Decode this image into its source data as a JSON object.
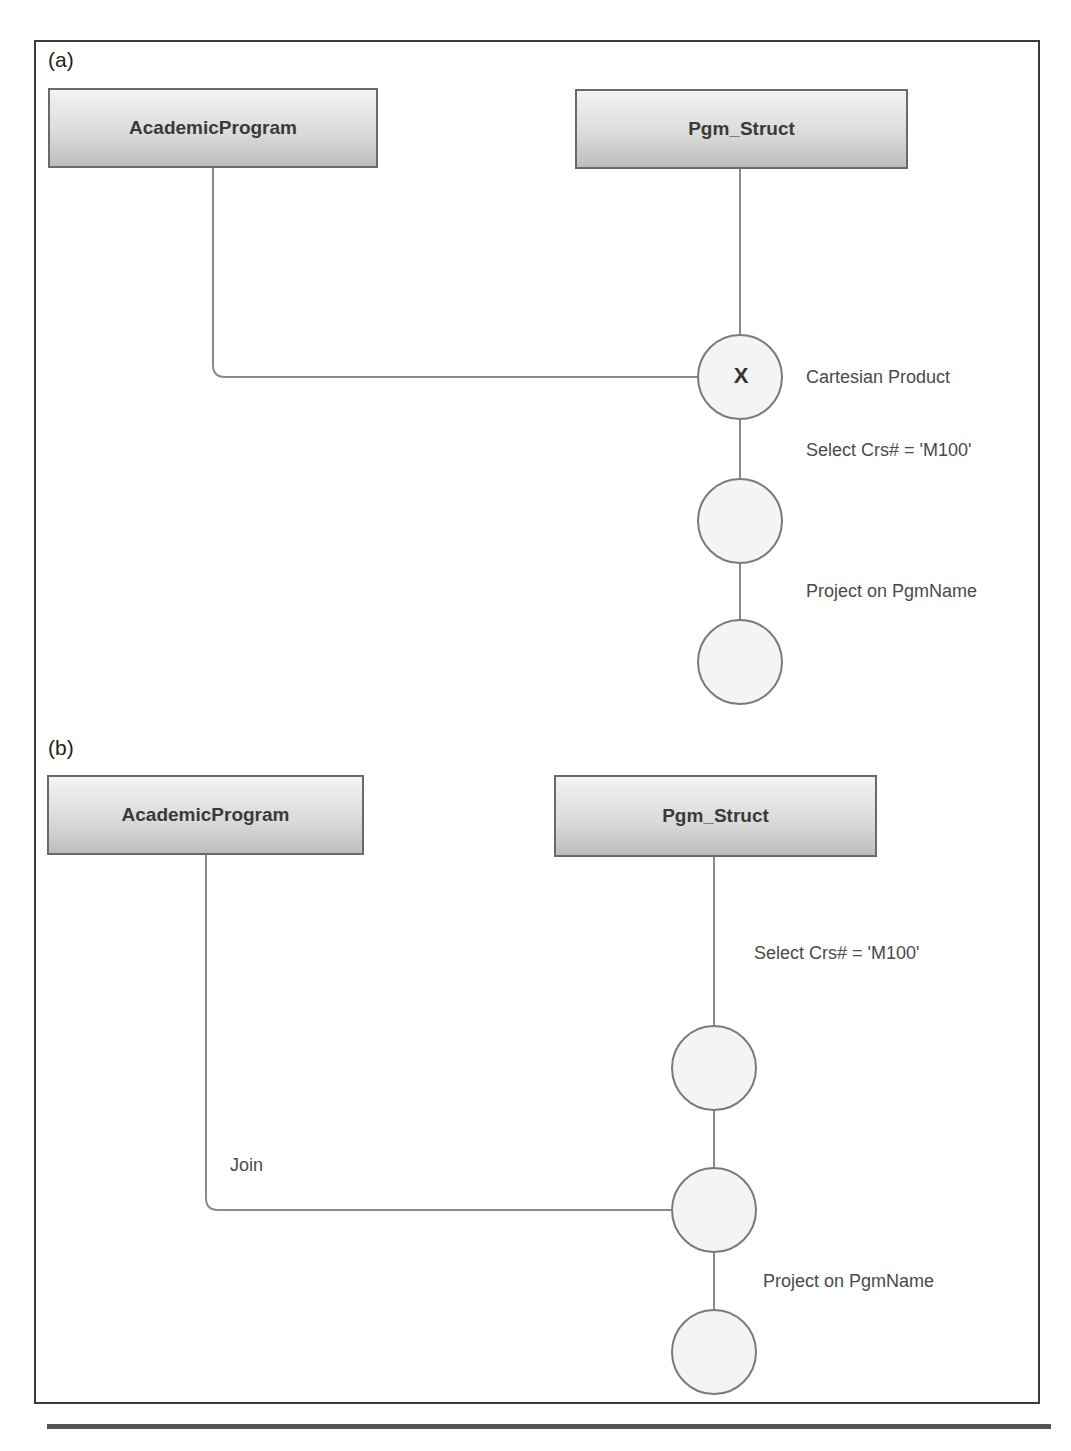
{
  "panels": [
    {
      "label": "(a)",
      "tables": [
        {
          "name": "AcademicProgram"
        },
        {
          "name": "Pgm_Struct"
        }
      ],
      "operations": [
        {
          "node_symbol": "X",
          "label": "Cartesian Product"
        },
        {
          "node_symbol": "",
          "label": "Select Crs# = 'M100'"
        },
        {
          "node_symbol": "",
          "label": "Project on PgmName"
        }
      ]
    },
    {
      "label": "(b)",
      "tables": [
        {
          "name": "AcademicProgram"
        },
        {
          "name": "Pgm_Struct"
        }
      ],
      "operations": [
        {
          "node_symbol": "",
          "label": "Select Crs# = 'M100'"
        },
        {
          "node_symbol": "",
          "label": "Join"
        },
        {
          "node_symbol": "",
          "label": "Project on PgmName"
        }
      ]
    }
  ],
  "colors": {
    "line": "#8a8a8a",
    "node_fill": "#f4f4f4",
    "node_stroke": "#7a7a7a",
    "frame": "#3c3c3c"
  }
}
